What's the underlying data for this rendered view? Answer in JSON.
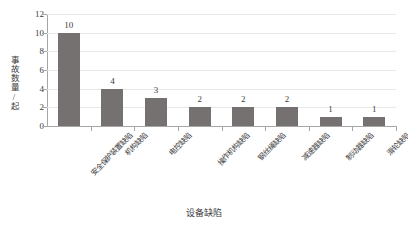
{
  "chart_data": {
    "type": "bar",
    "title": "",
    "xlabel": "设备缺陷",
    "ylabel": "事故数量/起",
    "ylim": [
      0,
      12
    ],
    "yticks": [
      0,
      2,
      4,
      6,
      8,
      10,
      12
    ],
    "grid": true,
    "legend": "none",
    "bar_color": "#767171",
    "gridline_color": "#E8E8E8",
    "axis_color": "#A6A6A6",
    "text_color": "#3C3C3C",
    "categories": [
      "安全保护装置缺陷",
      "机构缺陷",
      "电控缺陷",
      "操作机构缺陷",
      "钢丝绳缺陷",
      "减速器缺陷",
      "制动器缺陷",
      "滑轮缺陷"
    ],
    "values": [
      10,
      4,
      3,
      2,
      2,
      2,
      1,
      1
    ],
    "data_labels": [
      "10",
      "4",
      "3",
      "2",
      "2",
      "2",
      "1",
      "1"
    ],
    "ytick_labels": [
      "0",
      "2",
      "4",
      "6",
      "8",
      "10",
      "12"
    ]
  }
}
